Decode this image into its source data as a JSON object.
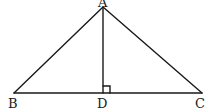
{
  "diagram": {
    "type": "triangle-with-altitude",
    "points": {
      "A": {
        "label": "A",
        "x": 103,
        "y": 7
      },
      "B": {
        "label": "B",
        "x": 14,
        "y": 93
      },
      "C": {
        "label": "C",
        "x": 202,
        "y": 93
      },
      "D": {
        "label": "D",
        "x": 103,
        "y": 93
      }
    },
    "segments": [
      "AB",
      "AC",
      "BC",
      "AD"
    ],
    "right_angle_at": "D",
    "colors": {
      "stroke": "#1a1a1a",
      "background": "#ffffff"
    }
  }
}
